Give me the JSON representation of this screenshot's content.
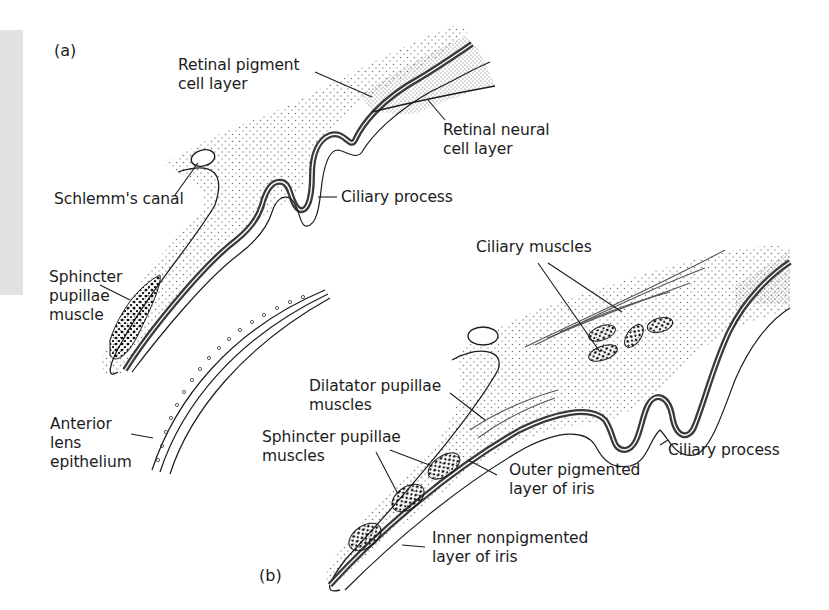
{
  "figure": {
    "panel_a_label": "(a)",
    "panel_b_label": "(b)",
    "colors": {
      "background": "#ffffff",
      "ink": "#1c1c1c",
      "pigment_layer": "#4a4a4a",
      "stipple": "#6a6a6a",
      "side_strip": "#e2e2e2"
    }
  },
  "panel_a": {
    "labels": {
      "retinal_pigment": [
        "Retinal pigment",
        "cell layer"
      ],
      "retinal_neural": [
        "Retinal neural",
        "cell layer"
      ],
      "schlemms_canal": "Schlemm's canal",
      "ciliary_process": "Ciliary process",
      "sphincter_pupillae": [
        "Sphincter",
        "pupillae",
        "muscle"
      ],
      "anterior_lens": [
        "Anterior",
        "lens",
        "epithelium"
      ]
    }
  },
  "panel_b": {
    "labels": {
      "ciliary_muscles": "Ciliary muscles",
      "dilatator_pupillae": [
        "Dilatator pupillae",
        "muscles"
      ],
      "sphincter_pupillae": [
        "Sphincter pupillae",
        "muscles"
      ],
      "ciliary_process": "Ciliary process",
      "outer_pigmented": [
        "Outer pigmented",
        "layer of iris"
      ],
      "inner_nonpigmented": [
        "Inner nonpigmented",
        "layer of iris"
      ]
    }
  }
}
